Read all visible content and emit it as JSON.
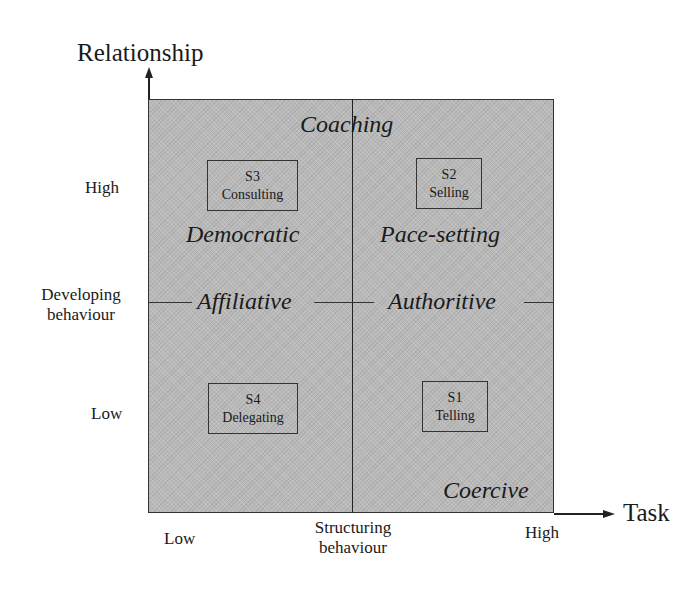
{
  "axes": {
    "y_axis_title": "Relationship",
    "x_axis_title": "Task",
    "y_ticks": {
      "high": "High",
      "middle_line1": "Developing",
      "middle_line2": "behaviour",
      "low": "Low"
    },
    "x_ticks": {
      "low": "Low",
      "middle_line1": "Structuring",
      "middle_line2": "behaviour",
      "high": "High"
    }
  },
  "quadrants": {
    "top_left": {
      "code": "S3",
      "name": "Consulting",
      "style": "Democratic"
    },
    "top_right": {
      "code": "S2",
      "name": "Selling",
      "style": "Pace-setting"
    },
    "bottom_left": {
      "code": "S4",
      "name": "Delegating"
    },
    "bottom_right": {
      "code": "S1",
      "name": "Telling"
    }
  },
  "boundary_labels": {
    "top": "Coaching",
    "left_middle": "Affiliative",
    "right_middle": "Authoritive",
    "bottom_right": "Coercive"
  },
  "colors": {
    "fill": "#b9b9b9",
    "lines": "#222222"
  }
}
